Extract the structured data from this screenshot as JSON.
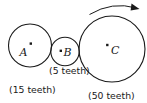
{
  "figure": {
    "background_color": "#ffffff",
    "stroke_color": "#1a1a1a"
  },
  "gears": [
    {
      "id": "a",
      "letter": "A",
      "teeth_label": "(15 teeth)",
      "teeth_count": 15,
      "cx": 30,
      "cy": 45.5,
      "r": 21.5
    },
    {
      "id": "b",
      "letter": "B",
      "teeth_label": "(5 teeth)",
      "teeth_count": 5,
      "cx": 65,
      "cy": 51.5,
      "r": 14.2
    },
    {
      "id": "c",
      "letter": "C",
      "teeth_label": "(50 teeth)",
      "teeth_count": 50,
      "cx": 112,
      "cy": 49,
      "r": 33
    }
  ],
  "rotation_indicator": {
    "name": "clockwise-rotation-arrow",
    "direction": "clockwise",
    "applies_to": "C"
  }
}
